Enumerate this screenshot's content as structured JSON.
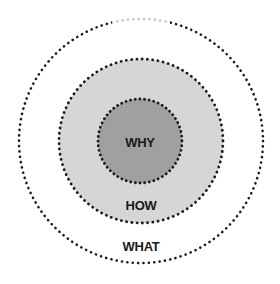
{
  "diagram": {
    "circles": [
      {
        "name": "what",
        "label": "WHAT",
        "fill": "#ffffff",
        "cx": 141,
        "cy": 141,
        "r": 122
      },
      {
        "name": "how",
        "label": "HOW",
        "fill": "#d6d6d6",
        "cx": 141,
        "cy": 141,
        "r": 82
      },
      {
        "name": "why",
        "label": "WHY",
        "fill": "#a0a0a0",
        "cx": 140,
        "cy": 141,
        "r": 42
      }
    ],
    "border_color": "#1a1a1a"
  }
}
